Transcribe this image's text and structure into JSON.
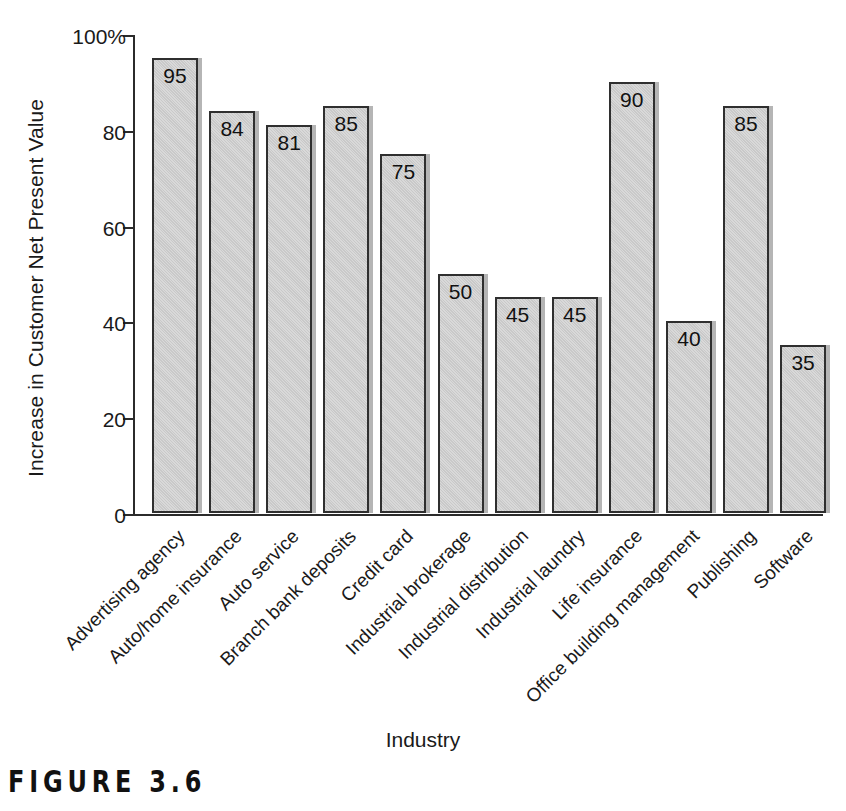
{
  "chart_data": {
    "type": "bar",
    "title": "",
    "xlabel": "Industry",
    "ylabel": "Increase in Customer Net Present Value",
    "ylim": [
      0,
      100
    ],
    "grid": false,
    "legend": "none",
    "y_ticks": [
      {
        "value": 0,
        "label": "0"
      },
      {
        "value": 20,
        "label": "20"
      },
      {
        "value": 40,
        "label": "40"
      },
      {
        "value": 60,
        "label": "60"
      },
      {
        "value": 80,
        "label": "80"
      },
      {
        "value": 100,
        "label": "100%"
      }
    ],
    "categories": [
      "Advertising agency",
      "Auto/home insurance",
      "Auto service",
      "Branch bank deposits",
      "Credit card",
      "Industrial brokerage",
      "Industrial distribution",
      "Industrial laundry",
      "Life insurance",
      "Office building management",
      "Publishing",
      "Software"
    ],
    "values": [
      95,
      84,
      81,
      85,
      75,
      50,
      45,
      45,
      90,
      40,
      85,
      35
    ],
    "bar_labels": [
      "95",
      "84",
      "81",
      "85",
      "75",
      "50",
      "45",
      "45",
      "90",
      "40",
      "85",
      "35"
    ],
    "colors": {
      "bar_fill": "#c9c9c9",
      "bar_border": "#2f2f2f",
      "axis": "#2b2b2b",
      "text": "#1a1a1a",
      "background": "#ffffff"
    }
  },
  "caption": {
    "figure_label": "FIGURE 3.6"
  }
}
